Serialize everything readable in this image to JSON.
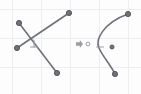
{
  "canvas": {
    "width": 141,
    "height": 94,
    "background_color": "#fdfdfd",
    "label": "sketch-canvas"
  },
  "grid": {
    "visible": true,
    "color": "#eceef0",
    "spacing_x": 29,
    "spacing_y": 29,
    "offset_x": 12,
    "offset_y": 9,
    "line_width": 1,
    "vertical_lines": [
      12,
      41,
      70,
      99,
      128
    ],
    "horizontal_lines": [
      9,
      38,
      67
    ]
  },
  "style": {
    "line_color": "#6e7178",
    "line_width": 1.6,
    "node_fill": "#6e7178",
    "node_stroke": "#4d5055",
    "node_radius": 2.6,
    "open_node_fill": "#fdfdfd",
    "open_node_stroke": "#8b8e94",
    "marker_color": "#9a9da3",
    "arrow_color": "#9a9da3"
  },
  "left_figure": {
    "name": "intersecting-segments",
    "segments": [
      {
        "name": "segment-a",
        "from": {
          "x": 19,
          "y": 23
        },
        "to": {
          "x": 57,
          "y": 73
        }
      },
      {
        "name": "segment-b",
        "from": {
          "x": 17,
          "y": 48
        },
        "to": {
          "x": 69,
          "y": 13
        }
      }
    ],
    "nodes": [
      {
        "name": "endpoint-upper-left",
        "x": 19,
        "y": 23,
        "type": "filled"
      },
      {
        "name": "endpoint-lower-right",
        "x": 57,
        "y": 73,
        "type": "filled"
      },
      {
        "name": "endpoint-mid-left",
        "x": 17,
        "y": 48,
        "type": "filled"
      },
      {
        "name": "endpoint-upper-right",
        "x": 69,
        "y": 13,
        "type": "filled"
      }
    ],
    "constraint_marker": {
      "name": "perpendicular-constraint-marker",
      "symbol": "perpendicular",
      "x": 34,
      "y": 47,
      "size": 7
    }
  },
  "transform_indicator": {
    "name": "transform-arrow",
    "symbol": "arrow-right",
    "x": 76,
    "y": 44,
    "width": 7,
    "height": 8
  },
  "right_figure": {
    "name": "spline-curve",
    "curve": {
      "name": "s-curve-path",
      "start": {
        "x": 128,
        "y": 14
      },
      "control_1": {
        "x": 103,
        "y": 23
      },
      "control_2": {
        "x": 95,
        "y": 40
      },
      "mid": {
        "x": 99,
        "y": 48
      },
      "control_3": {
        "x": 103,
        "y": 57
      },
      "control_4": {
        "x": 110,
        "y": 64
      },
      "end": {
        "x": 115,
        "y": 74
      }
    },
    "nodes": [
      {
        "name": "curve-endpoint-top",
        "x": 128,
        "y": 14,
        "type": "filled"
      },
      {
        "name": "curve-endpoint-bottom",
        "x": 115,
        "y": 74,
        "type": "filled"
      },
      {
        "name": "curve-control-point",
        "x": 112,
        "y": 47,
        "type": "filled-small"
      },
      {
        "name": "curve-anchor-open",
        "x": 88,
        "y": 44,
        "type": "open"
      }
    ],
    "tick_marker": {
      "name": "tangent-tick-marker",
      "x": 100,
      "y": 47,
      "length": 7
    }
  }
}
